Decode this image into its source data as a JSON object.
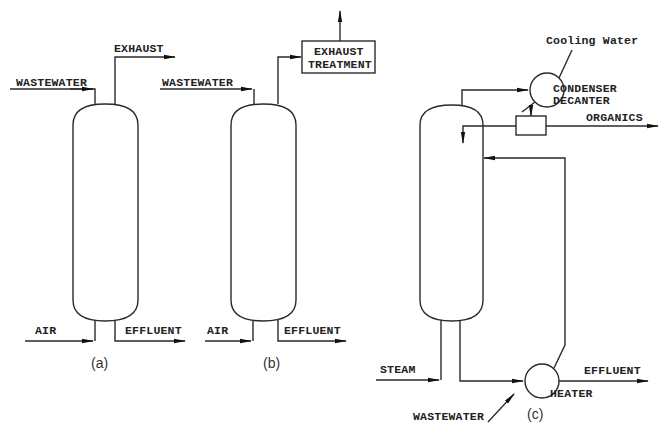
{
  "figure": {
    "panels": [
      {
        "id": "a",
        "caption": "(a)",
        "labels": {
          "wastewater": "WASTEWATER",
          "exhaust": "EXHAUST",
          "air": "AIR",
          "effluent": "EFFLUENT"
        }
      },
      {
        "id": "b",
        "caption": "(b)",
        "labels": {
          "wastewater": "WASTEWATER",
          "exhaust_treatment_line1": "EXHAUST",
          "exhaust_treatment_line2": "TREATMENT",
          "air": "AIR",
          "effluent": "EFFLUENT"
        }
      },
      {
        "id": "c",
        "caption": "(c)",
        "labels": {
          "cooling_water": "Cooling Water",
          "condenser": "CONDENSER",
          "decanter": "DECANTER",
          "organics": "ORGANICS",
          "steam": "STEAM",
          "effluent": "EFFLUENT",
          "heater": "HEATER",
          "wastewater": "WASTEWATER"
        }
      }
    ]
  },
  "colors": {
    "line": "#2a2a2a",
    "text": "#222222",
    "background": "#ffffff"
  }
}
